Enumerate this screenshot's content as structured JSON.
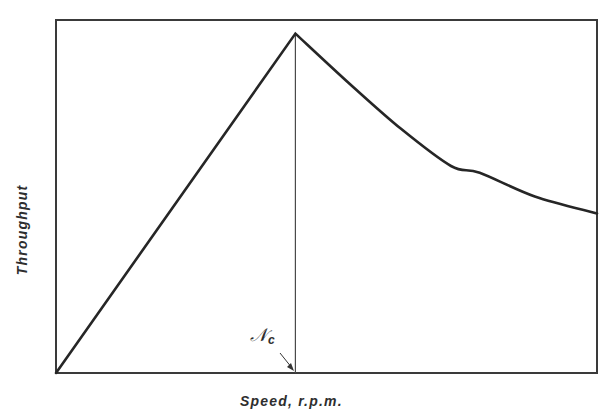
{
  "chart_data": {
    "type": "line",
    "title": "",
    "xlabel": "Speed, r.p.m.",
    "ylabel": "Throughput",
    "xlim": [
      0,
      2.26
    ],
    "ylim": [
      0,
      1.04
    ],
    "grid": false,
    "legend": null,
    "ticks": {
      "x": [],
      "y": []
    },
    "series": [
      {
        "name": "Throughput",
        "x": [
          0,
          1.0,
          1.23,
          1.44,
          1.65,
          1.77,
          2.0,
          2.26
        ],
        "values": [
          0,
          1.0,
          0.85,
          0.72,
          0.61,
          0.59,
          0.52,
          0.47
        ]
      }
    ],
    "annotations": [
      {
        "type": "vertical-line",
        "x": 1.0,
        "label": "N",
        "label_subscript": "c",
        "description": "Critical speed Nc; throughput peaks here, rising linearly before and falling off after"
      }
    ]
  },
  "labels": {
    "xlabel": "Speed, r.p.m.",
    "ylabel": "Throughput",
    "critical_main": "𝒩",
    "critical_sub": "c"
  },
  "colors": {
    "line": "#262626",
    "frame": "#3a3a3a",
    "background": "#ffffff"
  }
}
